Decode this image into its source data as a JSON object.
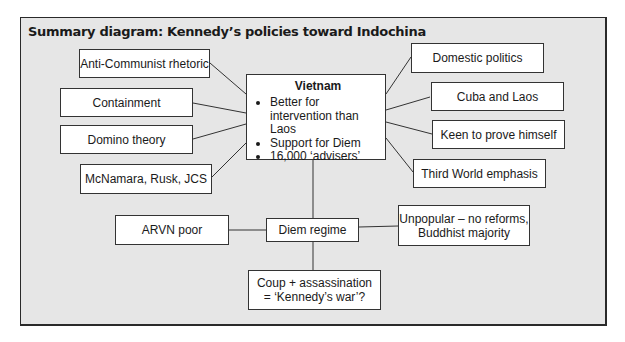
{
  "title": "Summary diagram: Kennedy’s policies toward Indochina",
  "center": {
    "heading": "Vietnam",
    "bullets": [
      "Better for intervention than Laos",
      "Support for Diem",
      "16,000 ‘advisers’"
    ]
  },
  "left_factors": [
    "Anti-Communist rhetoric",
    "Containment",
    "Domino theory",
    "McNamara, Rusk, JCS"
  ],
  "right_factors": [
    "Domestic politics",
    "Cuba and Laos",
    "Keen to prove himself",
    "Third World emphasis"
  ],
  "regime": {
    "label": "Diem regime",
    "left": "ARVN poor",
    "right_line1": "Unpopular – no reforms,",
    "right_line2": "Buddhist majority"
  },
  "outcome": {
    "line1": "Coup + assassination",
    "line2": "= ‘Kennedy’s war’?"
  },
  "colors": {
    "panel": "#e6e6e6",
    "box": "#ffffff",
    "border": "#333333"
  }
}
